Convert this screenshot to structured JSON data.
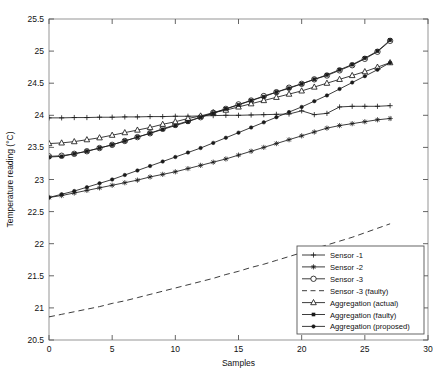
{
  "chart_data": {
    "type": "line",
    "title": "",
    "xlabel": "Samples",
    "ylabel": "Temperature reading (°C)",
    "xlim": [
      0,
      30
    ],
    "ylim": [
      20.5,
      25.5
    ],
    "xticks": [
      "0",
      "5",
      "10",
      "15",
      "20",
      "25",
      "30"
    ],
    "xtick_values": [
      0,
      5,
      10,
      15,
      20,
      25,
      30
    ],
    "yticks": [
      "20.5",
      "21",
      "21.5",
      "22",
      "22.5",
      "23",
      "23.5",
      "24",
      "24.5",
      "25",
      "25.5"
    ],
    "ytick_values": [
      20.5,
      21,
      21.5,
      22,
      22.5,
      23,
      23.5,
      24,
      24.5,
      25,
      25.5
    ],
    "grid": false,
    "legend_position": "lower right",
    "x": [
      0,
      1,
      2,
      3,
      4,
      5,
      6,
      7,
      8,
      9,
      10,
      11,
      12,
      13,
      14,
      15,
      16,
      17,
      18,
      19,
      20,
      21,
      22,
      23,
      24,
      25,
      26,
      27
    ],
    "series": [
      {
        "name": "Sensor -1",
        "marker": "plus",
        "linestyle": "solid",
        "color": "#1a1a1a",
        "values": [
          23.96,
          23.96,
          23.965,
          23.965,
          23.97,
          23.97,
          23.975,
          23.975,
          23.98,
          23.98,
          23.985,
          23.985,
          23.99,
          23.995,
          24.0,
          24.0,
          24.005,
          24.01,
          24.015,
          24.02,
          24.07,
          24.01,
          24.03,
          24.13,
          24.14,
          24.14,
          24.14,
          24.15
        ]
      },
      {
        "name": "Sensor -2",
        "marker": "star",
        "linestyle": "solid",
        "color": "#1a1a1a",
        "values": [
          22.72,
          22.75,
          22.79,
          22.83,
          22.87,
          22.91,
          22.95,
          22.99,
          23.04,
          23.08,
          23.12,
          23.17,
          23.22,
          23.27,
          23.32,
          23.38,
          23.44,
          23.5,
          23.56,
          23.62,
          23.68,
          23.74,
          23.8,
          23.84,
          23.87,
          23.9,
          23.93,
          23.95
        ]
      },
      {
        "name": "Sensor -3",
        "marker": "circle",
        "linestyle": "solid",
        "color": "#1a1a1a",
        "values": [
          23.36,
          23.37,
          23.4,
          23.44,
          23.49,
          23.54,
          23.6,
          23.66,
          23.72,
          23.79,
          23.85,
          23.91,
          23.97,
          24.04,
          24.1,
          24.17,
          24.23,
          24.3,
          24.36,
          24.43,
          24.49,
          24.56,
          24.62,
          24.7,
          24.78,
          24.88,
          24.99,
          25.16
        ]
      },
      {
        "name": "Sensor -3 (faulty)",
        "marker": "none",
        "linestyle": "dashed",
        "color": "#1a1a1a",
        "values": [
          20.86,
          20.9,
          20.94,
          20.98,
          21.02,
          21.07,
          21.11,
          21.16,
          21.21,
          21.26,
          21.31,
          21.36,
          21.41,
          21.46,
          21.52,
          21.57,
          21.63,
          21.68,
          21.74,
          21.8,
          21.86,
          21.92,
          21.98,
          22.04,
          22.1,
          22.17,
          22.24,
          22.31
        ]
      },
      {
        "name": "Aggregation (actual)",
        "marker": "triangle",
        "linestyle": "solid",
        "color": "#1a1a1a",
        "values": [
          23.56,
          23.57,
          23.59,
          23.62,
          23.65,
          23.69,
          23.73,
          23.77,
          23.81,
          23.86,
          23.9,
          23.95,
          23.99,
          24.04,
          24.08,
          24.13,
          24.18,
          24.23,
          24.28,
          24.33,
          24.38,
          24.44,
          24.5,
          24.56,
          24.62,
          24.68,
          24.75,
          24.82
        ]
      },
      {
        "name": "Aggregation (faulty)",
        "marker": "square",
        "linestyle": "solid",
        "color": "#1a1a1a",
        "values": [
          23.35,
          23.36,
          23.4,
          23.44,
          23.49,
          23.54,
          23.6,
          23.66,
          23.72,
          23.78,
          23.84,
          23.9,
          23.97,
          24.03,
          24.1,
          24.16,
          24.23,
          24.29,
          24.36,
          24.42,
          24.49,
          24.56,
          24.63,
          24.71,
          24.79,
          24.89,
          25.0,
          25.17
        ]
      },
      {
        "name": "Aggregation (proposed)",
        "marker": "dot",
        "linestyle": "solid",
        "color": "#1a1a1a",
        "values": [
          22.72,
          22.77,
          22.82,
          22.88,
          22.94,
          23.0,
          23.07,
          23.14,
          23.21,
          23.28,
          23.35,
          23.42,
          23.49,
          23.57,
          23.65,
          23.73,
          23.81,
          23.89,
          23.97,
          24.05,
          24.13,
          24.22,
          24.31,
          24.41,
          24.51,
          24.61,
          24.71,
          24.82
        ]
      }
    ],
    "legend": [
      {
        "label": "Sensor -1",
        "marker": "plus",
        "linestyle": "solid"
      },
      {
        "label": "Sensor -2",
        "marker": "star",
        "linestyle": "solid"
      },
      {
        "label": "Sensor -3",
        "marker": "circle",
        "linestyle": "solid"
      },
      {
        "label": "Sensor -3 (faulty)",
        "marker": "none",
        "linestyle": "dashed"
      },
      {
        "label": "Aggregation (actual)",
        "marker": "triangle",
        "linestyle": "solid"
      },
      {
        "label": "Aggregation (faulty)",
        "marker": "square",
        "linestyle": "solid"
      },
      {
        "label": "Aggregation (proposed)",
        "marker": "dot",
        "linestyle": "solid"
      }
    ]
  }
}
